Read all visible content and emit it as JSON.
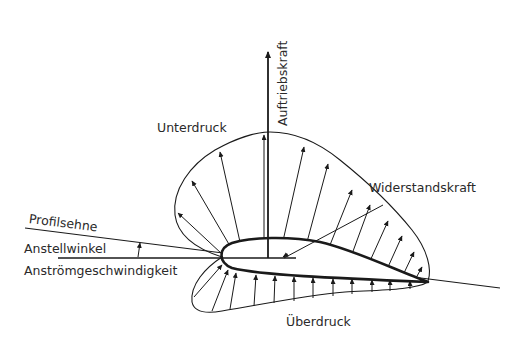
{
  "diagram": {
    "title": "",
    "labels": {
      "lift": "Auftriebskraft",
      "suction": "Unterdruck",
      "drag": "Widerstandskraft",
      "chord": "Profilsehne",
      "angle_of_attack": "Anstellwinkel",
      "inflow_velocity": "Anströmgeschwindigkeit",
      "overpressure": "Überdruck"
    },
    "colors": {
      "line": "#1a1a1a",
      "text": "#2a2a2a",
      "background": "#ffffff"
    }
  }
}
